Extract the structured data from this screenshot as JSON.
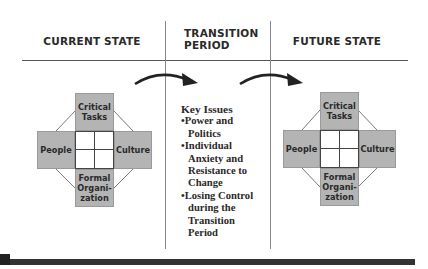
{
  "columns": {
    "current": {
      "label": "Current State"
    },
    "transition": {
      "label_line1": "Transition",
      "label_line2": "Period"
    },
    "future": {
      "label": "Future state"
    }
  },
  "congruence_model": {
    "top": {
      "line1": "Critical",
      "line2": "Tasks"
    },
    "left": "People",
    "right": "Culture",
    "bottom": {
      "line1": "Formal",
      "line2": "Organi-",
      "line3": "zation"
    }
  },
  "key_issues": {
    "title": "Key Issues",
    "items": [
      {
        "bullet": "•",
        "lines": [
          "Power and",
          "Politics"
        ]
      },
      {
        "bullet": "•",
        "lines": [
          "Individual",
          "Anxiety and",
          "Resistance to",
          "Change"
        ]
      },
      {
        "bullet": "•",
        "lines": [
          "Losing Control",
          "during the",
          "Transition",
          "Period"
        ]
      }
    ]
  },
  "colors": {
    "box_fill": "#b4b4b4",
    "line": "#555555",
    "arrow": "#222222",
    "bottom_bar": "#333333"
  }
}
